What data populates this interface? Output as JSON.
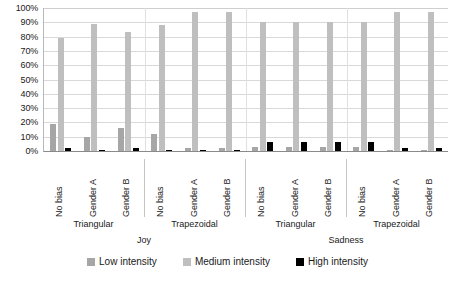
{
  "chart_data": {
    "type": "bar",
    "title": "",
    "xlabel": "",
    "ylabel": "",
    "ylim": [
      0,
      100
    ],
    "grid": true,
    "legend_position": "bottom",
    "y_ticks": [
      "0%",
      "10%",
      "20%",
      "30%",
      "40%",
      "50%",
      "60%",
      "70%",
      "80%",
      "90%",
      "100%"
    ],
    "y_tick_values": [
      0,
      10,
      20,
      30,
      40,
      50,
      60,
      70,
      80,
      90,
      100
    ],
    "categories": [
      "No bias",
      "Gender A",
      "Gender B",
      "No bias",
      "Gender A",
      "Gender B",
      "No bias",
      "Gender A",
      "Gender B",
      "No bias",
      "Gender A",
      "Gender B"
    ],
    "group_level_1": [
      {
        "label": "Triangular",
        "span": 3
      },
      {
        "label": "Trapezoidal",
        "span": 3
      },
      {
        "label": "Triangular",
        "span": 3
      },
      {
        "label": "Trapezoidal",
        "span": 3
      }
    ],
    "group_level_2": [
      {
        "label": "Joy",
        "span": 6
      },
      {
        "label": "Sadness",
        "span": 6
      }
    ],
    "series": [
      {
        "name": "Low intensity",
        "color": "#a6a6a6",
        "values": [
          19,
          10,
          16,
          12,
          2,
          2,
          3,
          3,
          3,
          3,
          1,
          1
        ]
      },
      {
        "name": "Medium intensity",
        "color": "#bfbfbf",
        "values": [
          79,
          89,
          83,
          88,
          97,
          97,
          90,
          90,
          90,
          90,
          97,
          97
        ]
      },
      {
        "name": "High intensity",
        "color": "#000000",
        "values": [
          2,
          1,
          2,
          1,
          1,
          1,
          6,
          6,
          6,
          6,
          2,
          2
        ]
      }
    ]
  },
  "legend": {
    "items": [
      {
        "label": "Low intensity"
      },
      {
        "label": "Medium intensity"
      },
      {
        "label": "High intensity"
      }
    ]
  }
}
